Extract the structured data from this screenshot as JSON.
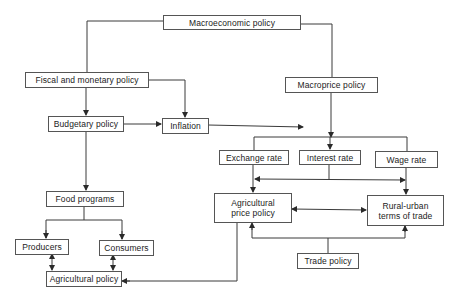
{
  "diagram": {
    "nodes": {
      "macroeconomic_policy": "Macroeconomic policy",
      "fiscal_monetary_policy": "Fiscal and monetary policy",
      "macroprice_policy": "Macroprice policy",
      "budgetary_policy": "Budgetary policy",
      "inflation": "Inflation",
      "exchange_rate": "Exchange rate",
      "interest_rate": "Interest rate",
      "wage_rate": "Wage rate",
      "agricultural_price_policy": "Agricultural price policy",
      "rural_urban_terms_of_trade": "Rural-urban terms of trade",
      "food_programs": "Food programs",
      "producers": "Producers",
      "consumers": "Consumers",
      "agricultural_policy": "Agricultural policy",
      "trade_policy": "Trade policy"
    },
    "edges": [
      {
        "from": "Macroeconomic policy",
        "to": "Fiscal and monetary policy"
      },
      {
        "from": "Macroeconomic policy",
        "to": "Macroprice policy"
      },
      {
        "from": "Fiscal and monetary policy",
        "to": "Budgetary policy"
      },
      {
        "from": "Fiscal and monetary policy",
        "to": "Inflation"
      },
      {
        "from": "Budgetary policy",
        "to": "Inflation"
      },
      {
        "from": "Inflation",
        "to": "Macroprice outputs"
      },
      {
        "from": "Macroprice policy",
        "to": "Interest rate"
      },
      {
        "from": "Macroprice policy",
        "to": "Exchange rate"
      },
      {
        "from": "Macroprice policy",
        "to": "Wage rate"
      },
      {
        "from": "Interest rate",
        "to": "Exchange rate / Wage rate link",
        "bidirectional": true
      },
      {
        "from": "Exchange rate",
        "to": "Agricultural price policy"
      },
      {
        "from": "Wage rate",
        "to": "Rural-urban terms of trade"
      },
      {
        "from": "Agricultural price policy",
        "to": "Rural-urban terms of trade",
        "bidirectional": true
      },
      {
        "from": "Trade policy",
        "to": "Agricultural price policy"
      },
      {
        "from": "Trade policy",
        "to": "Rural-urban terms of trade"
      },
      {
        "from": "Budgetary policy",
        "to": "Food programs"
      },
      {
        "from": "Food programs",
        "to": "Producers"
      },
      {
        "from": "Food programs",
        "to": "Consumers"
      },
      {
        "from": "Producers",
        "to": "Agricultural policy",
        "bidirectional": true
      },
      {
        "from": "Consumers",
        "to": "Agricultural policy",
        "bidirectional": true
      },
      {
        "from": "Agricultural price policy",
        "to": "Agricultural policy"
      }
    ],
    "colors": {
      "line": "#3a3a3a",
      "border": "#555555",
      "text": "#222222",
      "background": "#ffffff"
    }
  }
}
